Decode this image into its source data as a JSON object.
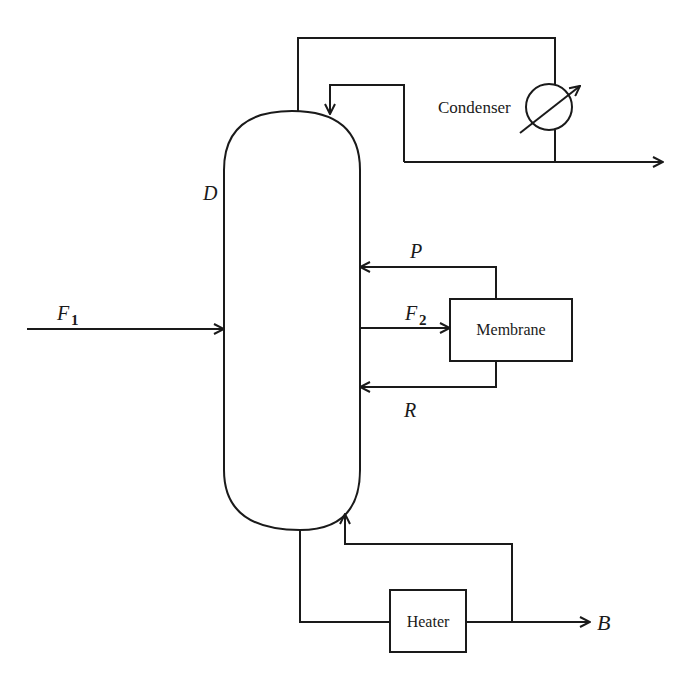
{
  "diagram": {
    "type": "process-flow",
    "column": {
      "label": "D"
    },
    "condenser": {
      "label": "Condenser"
    },
    "membrane": {
      "label": "Membrane"
    },
    "heater": {
      "label": "Heater"
    },
    "streams": {
      "feed1": {
        "label": "F",
        "sub": "1"
      },
      "feed2": {
        "label": "F",
        "sub": "2"
      },
      "permeate": {
        "label": "P"
      },
      "retentate": {
        "label": "R"
      },
      "bottoms": {
        "label": "B"
      }
    }
  }
}
